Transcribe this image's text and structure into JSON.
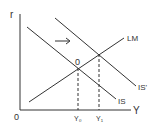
{
  "diagram": {
    "type": "IS-LM model",
    "axes": {
      "y_label": "r",
      "x_label": "Y",
      "origin_label": "0"
    },
    "curves": [
      {
        "name": "IS",
        "label": "IS"
      },
      {
        "name": "IS-prime",
        "label": "IS'"
      },
      {
        "name": "LM",
        "label": "LM"
      }
    ],
    "equilibrium_label": "0",
    "x_ticks": [
      "Y₀",
      "Y₁"
    ],
    "shift_arrow": "→",
    "colors": {
      "line": "#333333",
      "background": "#ffffff"
    }
  }
}
